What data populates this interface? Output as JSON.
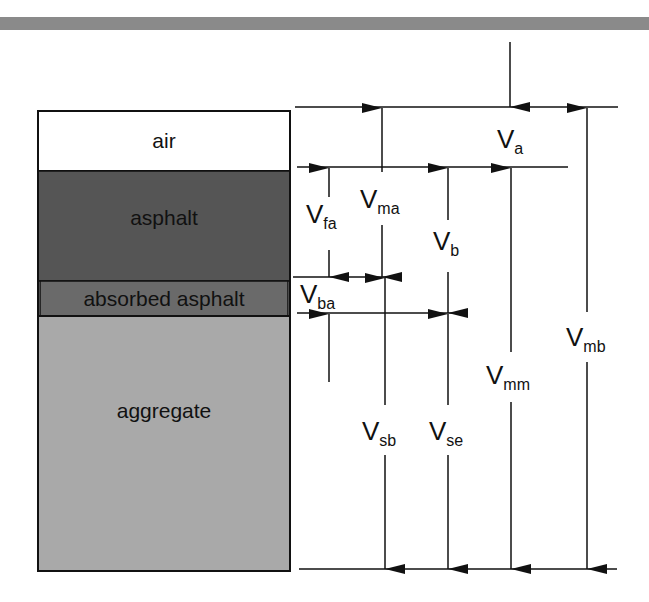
{
  "colors": {
    "air": "#ffffff",
    "asphalt": "#555555",
    "absorbed_asphalt": "#6a6a6a",
    "aggregate": "#a9a9a9",
    "line": "#111111",
    "top_band": "#8a8a8a"
  },
  "layers": [
    {
      "name": "air",
      "label": "air"
    },
    {
      "name": "asphalt",
      "label": "asphalt"
    },
    {
      "name": "absorbed-asphalt",
      "label": "absorbed asphalt"
    },
    {
      "name": "aggregate",
      "label": "aggregate"
    }
  ],
  "volume_labels": {
    "va": {
      "main": "V",
      "sub": "a"
    },
    "vma": {
      "main": "V",
      "sub": "ma"
    },
    "vfa": {
      "main": "V",
      "sub": "fa"
    },
    "vb": {
      "main": "V",
      "sub": "b"
    },
    "vba": {
      "main": "V",
      "sub": "ba"
    },
    "vmb": {
      "main": "V",
      "sub": "mb"
    },
    "vmm": {
      "main": "V",
      "sub": "mm"
    },
    "vsb": {
      "main": "V",
      "sub": "sb"
    },
    "vse": {
      "main": "V",
      "sub": "se"
    }
  }
}
